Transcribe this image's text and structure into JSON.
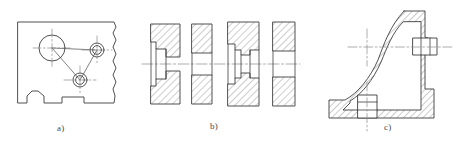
{
  "sheet": {
    "title": "Sectional views of machine parts",
    "background_color": "#ffffff",
    "line_color": "#3c3c3c",
    "hatch_color": "#6e6e6e",
    "centerline_color": "#8a8a8a",
    "width_px": 466,
    "height_px": 147
  },
  "figures": [
    {
      "id": "a",
      "caption": "a)",
      "description": "Plate with three bored holes, broken-out right edge and notched bottom profile",
      "features": {
        "holes": [
          {
            "name": "large-bore",
            "cx": 52,
            "cy": 48,
            "r": 13
          },
          {
            "name": "upper-right-bore",
            "cx": 97,
            "cy": 50,
            "r": 7
          },
          {
            "name": "lower-bore",
            "cx": 80,
            "cy": 80,
            "r": 7
          }
        ],
        "bottom_notches": 2,
        "break_line_edge": "right"
      }
    },
    {
      "id": "b",
      "caption": "b)",
      "description": "Four hatched ring sections on a common horizontal axis showing different internal bore profiles",
      "features": {
        "ring_count": 4,
        "ring_profiles": [
          "stepped-counterbore",
          "straight-bore",
          "double-tapered-bore",
          "straight-bore"
        ],
        "common_axis": "horizontal centerline"
      }
    },
    {
      "id": "c",
      "caption": "c)",
      "description": "L-shaped bracket casting in full section with two cylindrical bosses and crossed centerlines",
      "features": {
        "bosses": [
          {
            "name": "right-vertical-boss",
            "axis": "horizontal"
          },
          {
            "name": "bottom-horizontal-boss",
            "axis": "vertical"
          }
        ],
        "centerline_crosses": 3,
        "profile": "L-shaped casting with curved upper-left contour"
      }
    }
  ],
  "captions": {
    "a": "a)",
    "b": "b)",
    "c": "c)"
  }
}
